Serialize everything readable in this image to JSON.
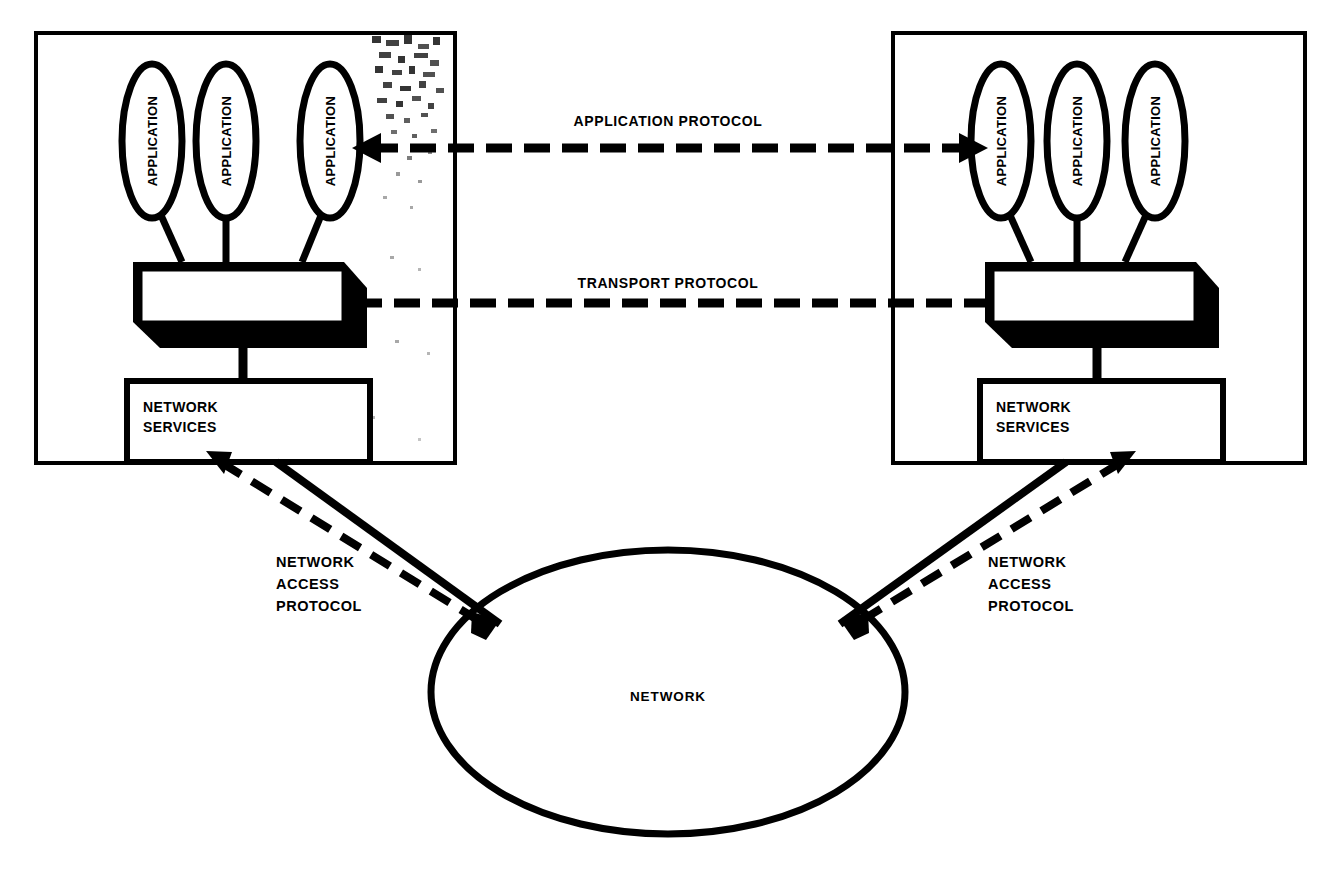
{
  "diagram": {
    "colors": {
      "ink": "#000000",
      "paper": "#ffffff"
    },
    "hosts": [
      {
        "id": "left-host",
        "applications": [
          {
            "label": "APPLICATION"
          },
          {
            "label": "APPLICATION"
          },
          {
            "label": "APPLICATION"
          }
        ],
        "transport_block": {
          "label": ""
        },
        "network_services": {
          "line1": "NETWORK",
          "line2": "SERVICES"
        }
      },
      {
        "id": "right-host",
        "applications": [
          {
            "label": "APPLICATION"
          },
          {
            "label": "APPLICATION"
          },
          {
            "label": "APPLICATION"
          }
        ],
        "transport_block": {
          "label": ""
        },
        "network_services": {
          "line1": "NETWORK",
          "line2": "SERVICES"
        }
      }
    ],
    "protocols": {
      "application": {
        "label": "APPLICATION PROTOCOL"
      },
      "transport": {
        "label": "TRANSPORT PROTOCOL"
      },
      "network_access_left": {
        "line1": "NETWORK",
        "line2": "ACCESS",
        "line3": "PROTOCOL"
      },
      "network_access_right": {
        "line1": "NETWORK",
        "line2": "ACCESS",
        "line3": "PROTOCOL"
      }
    },
    "network_cloud": {
      "label": "NETWORK"
    }
  }
}
